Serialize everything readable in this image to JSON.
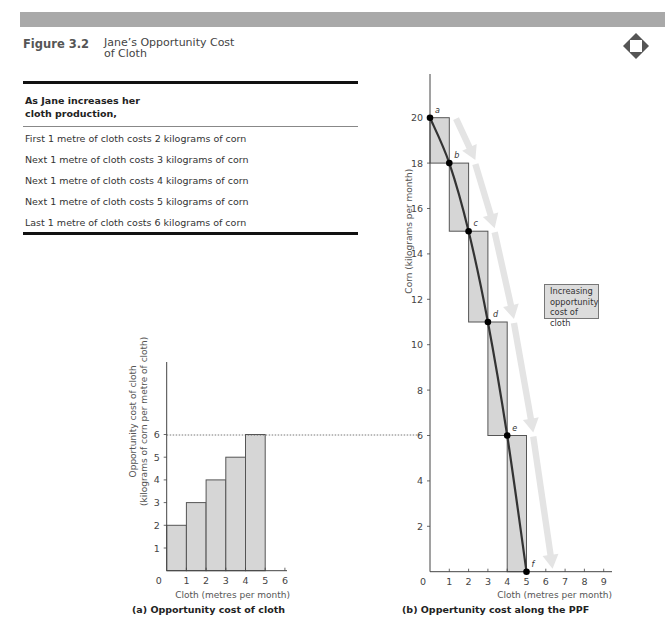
{
  "header": {
    "figure_number": "Figure 3.2",
    "figure_title_line1": "Jane’s Opportunity Cost",
    "figure_title_line2": "of Cloth",
    "icon": "diamond-nav-icon"
  },
  "table": {
    "heading_line1": "As Jane increases her",
    "heading_line2": "cloth production,",
    "rows": [
      "First 1 metre of cloth costs 2 kilograms of corn",
      "Next 1 metre of cloth costs 3 kilograms of corn",
      "Next 1 metre of cloth costs 4 kilograms of corn",
      "Next 1 metre of cloth costs 5 kilograms of corn",
      "Last 1 metre of cloth costs 6 kilograms of corn"
    ]
  },
  "colors": {
    "bar_fill": "#d6d6d6",
    "bar_stroke": "#555555",
    "ppf_line": "#333333",
    "arrow": "#e4e4e4",
    "top_bar": "#a9a9a9"
  },
  "chart_data": [
    {
      "type": "bar",
      "title": "(a) Opportunity cost of cloth",
      "xlabel": "Cloth (metres per month)",
      "ylabel_line1": "Opportunity cost of cloth",
      "ylabel_line2": "(kilograms of corn per metre of cloth)",
      "x_ticks": [
        "0",
        "1",
        "2",
        "3",
        "4",
        "5",
        "6"
      ],
      "y_ticks": [
        "1",
        "2",
        "3",
        "4",
        "5",
        "6"
      ],
      "xlim": [
        0,
        6
      ],
      "ylim": [
        0,
        10
      ],
      "bins": [
        [
          0,
          1
        ],
        [
          1,
          2
        ],
        [
          2,
          3
        ],
        [
          3,
          4
        ],
        [
          4,
          5
        ]
      ],
      "values": [
        2,
        3,
        4,
        5,
        6
      ],
      "reference_line_y": 6
    },
    {
      "type": "line",
      "title": "(b) Oppertunity cost along the PPF",
      "xlabel": "Cloth (metres per month)",
      "ylabel": "Corn (kilograms per month)",
      "x_ticks": [
        "0",
        "1",
        "2",
        "3",
        "4",
        "5",
        "6",
        "7",
        "8",
        "9"
      ],
      "y_ticks": [
        "2",
        "4",
        "6",
        "8",
        "10",
        "12",
        "14",
        "16",
        "18",
        "20"
      ],
      "xlim": [
        0,
        9
      ],
      "ylim": [
        0,
        22
      ],
      "points": [
        {
          "label": "a",
          "x": 0,
          "y": 20
        },
        {
          "label": "b",
          "x": 1,
          "y": 18
        },
        {
          "label": "c",
          "x": 2,
          "y": 15
        },
        {
          "label": "d",
          "x": 3,
          "y": 11
        },
        {
          "label": "e",
          "x": 4,
          "y": 6
        },
        {
          "label": "f",
          "x": 5,
          "y": 0
        }
      ],
      "annotation": {
        "line1": "Increasing",
        "line2": "opportunity",
        "line3": "cost of cloth"
      }
    }
  ]
}
